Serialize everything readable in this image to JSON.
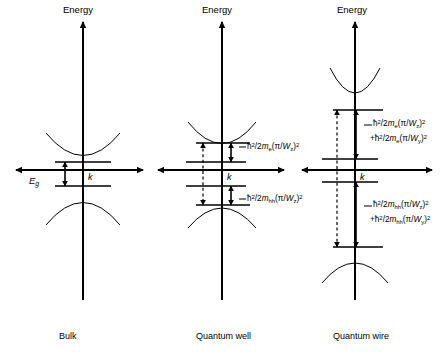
{
  "figure": {
    "background_color": "#ffffff",
    "line_color": "#000000",
    "panels": [
      {
        "id": "bulk",
        "caption": "Bulk",
        "axis_y_label": "Energy",
        "axis_x_label": "k",
        "gap_label_html": "E<sub>g</sub>",
        "gap_label_text": "Eg",
        "annotations": []
      },
      {
        "id": "quantum-well",
        "caption": "Quantum well",
        "axis_y_label": "Energy",
        "axis_x_label": "k",
        "annotations": [
          {
            "id": "qw-electron-confinement",
            "text": "ħ²/2m_e(π/W_z)²",
            "html": "ħ<sup>2</sup>/2<i>m</i><sub>e</sub>(π/<i>W</i><sub>z</sub>)<sup>2</sup>"
          },
          {
            "id": "qw-hole-confinement",
            "text": "ħ²/2m_hh(π/W_z)²",
            "html": "ħ<sup>2</sup>/2<i>m</i><sub>hh</sub>(π/<i>W</i><sub>z</sub>)<sup>2</sup>"
          }
        ]
      },
      {
        "id": "quantum-wire",
        "caption": "Quantum wire",
        "axis_y_label": "Energy",
        "axis_x_label": "k",
        "annotations": [
          {
            "id": "qwire-electron-confinement-line1",
            "text": "ħ²/2m_e(π/W_z)²",
            "html": "ħ<sup>2</sup>/2<i>m</i><sub>e</sub>(π/<i>W</i><sub>z</sub>)<sup>2</sup>"
          },
          {
            "id": "qwire-electron-confinement-line2",
            "text": "+ħ²/2m_e(π/W_y)²",
            "html": "+ħ<sup>2</sup>/2<i>m</i><sub>e</sub>(π/<i>W</i><sub>y</sub>)<sup>2</sup>"
          },
          {
            "id": "qwire-hole-confinement-line1",
            "text": "ħ²/2m_hh(π/W_z)²",
            "html": "ħ<sup>2</sup>/2<i>m</i><sub>hh</sub>(π/<i>W</i><sub>z</sub>)<sup>2</sup>"
          },
          {
            "id": "qwire-hole-confinement-line2",
            "text": "+ħ²/2m_hh(π/W_y)²",
            "html": "+ħ<sup>2</sup>/2<i>m</i><sub>hh</sub>(π/<i>W</i><sub>y</sub>)<sup>2</sup>"
          }
        ]
      }
    ]
  }
}
